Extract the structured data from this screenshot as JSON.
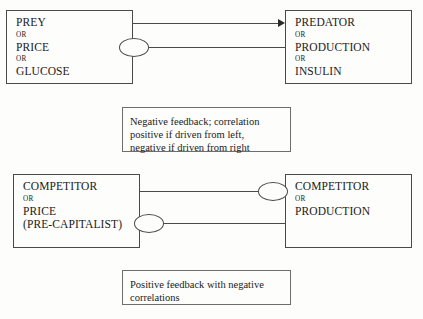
{
  "diagram": {
    "colors": {
      "background": "#fdfdfc",
      "box_border": "#4a4a4a",
      "caption_border": "#6e6e6e",
      "line": "#4a4a4a",
      "arrow": "#2a2a2a",
      "text": "#1a1a1a"
    },
    "nodes": [
      {
        "id": "prey",
        "lines": [
          {
            "kind": "term",
            "text": "PREY"
          },
          {
            "kind": "conj",
            "text": "or"
          },
          {
            "kind": "term",
            "text": "PRICE"
          },
          {
            "kind": "conj",
            "text": "or"
          },
          {
            "kind": "term",
            "text": "GLUCOSE"
          }
        ]
      },
      {
        "id": "predator",
        "lines": [
          {
            "kind": "term",
            "text": "PREDATOR"
          },
          {
            "kind": "conj",
            "text": "or"
          },
          {
            "kind": "term",
            "text": "PRODUCTION"
          },
          {
            "kind": "conj",
            "text": "or"
          },
          {
            "kind": "term",
            "text": "INSULIN"
          }
        ]
      },
      {
        "id": "competitor-left",
        "lines": [
          {
            "kind": "term",
            "text": "COMPETITOR"
          },
          {
            "kind": "conj",
            "text": "or"
          },
          {
            "kind": "term",
            "text": "PRICE"
          },
          {
            "kind": "term",
            "text": "(PRE-CAPITALIST)"
          }
        ]
      },
      {
        "id": "competitor-right",
        "lines": [
          {
            "kind": "term",
            "text": "COMPETITOR"
          },
          {
            "kind": "conj",
            "text": "or"
          },
          {
            "kind": "term",
            "text": "PRODUCTION"
          }
        ]
      }
    ],
    "captions": [
      {
        "id": "negative",
        "lines": [
          "Negative feedback; correlation",
          "positive if driven from left,",
          "negative if driven from right"
        ]
      },
      {
        "id": "positive",
        "lines": [
          "Positive feedback with negative",
          "correlations"
        ]
      }
    ],
    "connectors": [
      {
        "id": "top-arrow",
        "from": "prey",
        "to": "predator",
        "marker": "arrowhead",
        "marker_end": "right"
      },
      {
        "id": "top-ellipse",
        "from": "prey",
        "to": "predator",
        "marker": "ellipse",
        "marker_end": "left"
      },
      {
        "id": "bottom-upper",
        "from": "competitor-left",
        "to": "competitor-right",
        "marker": "ellipse",
        "marker_end": "right"
      },
      {
        "id": "bottom-lower",
        "from": "competitor-left",
        "to": "competitor-right",
        "marker": "ellipse",
        "marker_end": "left"
      }
    ]
  }
}
